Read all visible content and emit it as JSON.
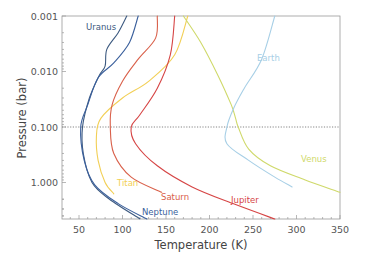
{
  "chart_data": {
    "type": "line",
    "title": "",
    "xlabel": "Temperature (K)",
    "ylabel": "Pressure (bar)",
    "xlim": [
      36,
      350
    ],
    "ylim": [
      5.0,
      0.001
    ],
    "y_scale": "log",
    "y_inverted": true,
    "grid": false,
    "reference_line": {
      "y": 0.1,
      "style": "dotted",
      "color": "#777777"
    },
    "x_ticks": [
      "50",
      "100",
      "150",
      "200",
      "250",
      "300",
      "350"
    ],
    "x_tick_values": [
      50,
      100,
      150,
      200,
      250,
      300,
      350
    ],
    "y_ticks": [
      "0.001",
      "0.010",
      "0.100",
      "1.000"
    ],
    "y_tick_values": [
      0.001,
      0.01,
      0.1,
      1.0
    ],
    "legend": "inline labels",
    "series": [
      {
        "name": "Uranus",
        "color": "#3d5a80",
        "points": [
          [
            105,
            0.001
          ],
          [
            95,
            0.002
          ],
          [
            82,
            0.004
          ],
          [
            80,
            0.008
          ],
          [
            73,
            0.012
          ],
          [
            62,
            0.03
          ],
          [
            54,
            0.1
          ],
          [
            55,
            0.3
          ],
          [
            65,
            1.0
          ],
          [
            85,
            2.0
          ],
          [
            120,
            4.5
          ]
        ]
      },
      {
        "name": "Neptune",
        "color": "#3a5f9c",
        "points": [
          [
            118,
            0.001
          ],
          [
            108,
            0.003
          ],
          [
            90,
            0.007
          ],
          [
            72,
            0.013
          ],
          [
            60,
            0.04
          ],
          [
            52,
            0.1
          ],
          [
            56,
            0.4
          ],
          [
            68,
            1.1
          ],
          [
            95,
            2.4
          ],
          [
            128,
            4.8
          ]
        ]
      },
      {
        "name": "Titan",
        "color": "#f2cf55",
        "points": [
          [
            175,
            0.001
          ],
          [
            160,
            0.005
          ],
          [
            130,
            0.015
          ],
          [
            100,
            0.03
          ],
          [
            75,
            0.07
          ],
          [
            70,
            0.15
          ],
          [
            72,
            0.4
          ],
          [
            80,
            1.0
          ],
          [
            90,
            1.6
          ]
        ]
      },
      {
        "name": "Saturn",
        "color": "#d9604a",
        "points": [
          [
            140,
            0.001
          ],
          [
            138,
            0.0025
          ],
          [
            118,
            0.006
          ],
          [
            100,
            0.015
          ],
          [
            88,
            0.04
          ],
          [
            86,
            0.1
          ],
          [
            90,
            0.3
          ],
          [
            110,
            0.8
          ],
          [
            145,
            1.5
          ]
        ]
      },
      {
        "name": "Jupiter",
        "color": "#d64545",
        "points": [
          [
            160,
            0.001
          ],
          [
            155,
            0.005
          ],
          [
            140,
            0.02
          ],
          [
            120,
            0.06
          ],
          [
            110,
            0.1
          ],
          [
            115,
            0.2
          ],
          [
            140,
            0.5
          ],
          [
            180,
            1.2
          ],
          [
            230,
            2.5
          ],
          [
            275,
            5.0
          ]
        ]
      },
      {
        "name": "Venus",
        "color": "#cfd96a",
        "points": [
          [
            170,
            0.001
          ],
          [
            190,
            0.003
          ],
          [
            210,
            0.012
          ],
          [
            225,
            0.04
          ],
          [
            230,
            0.07
          ],
          [
            233,
            0.1
          ],
          [
            245,
            0.25
          ],
          [
            270,
            0.5
          ],
          [
            310,
            0.9
          ],
          [
            350,
            1.5
          ]
        ]
      },
      {
        "name": "Earth",
        "color": "#a7cfe6",
        "points": [
          [
            275,
            0.001
          ],
          [
            260,
            0.006
          ],
          [
            240,
            0.02
          ],
          [
            228,
            0.045
          ],
          [
            220,
            0.1
          ],
          [
            220,
            0.2
          ],
          [
            245,
            0.4
          ],
          [
            275,
            0.8
          ],
          [
            295,
            1.2
          ]
        ]
      }
    ],
    "annotations": [
      {
        "text": "Uranus",
        "x": 118,
        "y": 0.0017
      },
      {
        "text": "Earth",
        "x": 235,
        "y": 0.012
      },
      {
        "text": "Venus",
        "x": 310,
        "y": 0.45
      },
      {
        "text": "Titan",
        "x": 88,
        "y": 1.35
      },
      {
        "text": "Saturn",
        "x": 133,
        "y": 2.4
      },
      {
        "text": "Jupiter",
        "x": 222,
        "y": 2.5
      },
      {
        "text": "Neptune",
        "x": 128,
        "y": 3.8
      }
    ]
  },
  "axes": {
    "xlabel": "Temperature (K)",
    "ylabel": "Pressure (bar)",
    "x_ticks": [
      "50",
      "100",
      "150",
      "200",
      "250",
      "300",
      "350"
    ],
    "y_ticks": [
      "0.001",
      "0.010",
      "0.100",
      "1.000"
    ]
  },
  "labels": {
    "uranus": "Uranus",
    "neptune": "Neptune",
    "titan": "Titan",
    "saturn": "Saturn",
    "jupiter": "Jupiter",
    "venus": "Venus",
    "earth": "Earth"
  },
  "colors": {
    "uranus": "#3d5a80",
    "neptune": "#3a5f9c",
    "titan": "#f2cf55",
    "saturn": "#d9604a",
    "jupiter": "#d64545",
    "venus": "#cfd96a",
    "earth": "#a7cfe6",
    "axis": "#9a9a9a"
  }
}
